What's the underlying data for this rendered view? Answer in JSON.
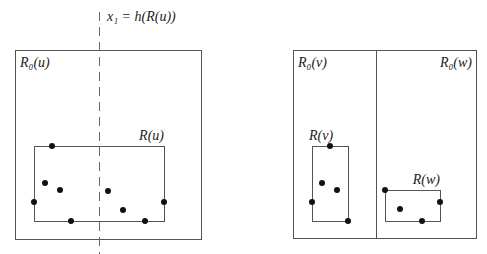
{
  "diagram": {
    "split_label": "x₁ = h(R(u))",
    "left_panel": {
      "outer": {
        "label": "R₀(u)",
        "x": 15,
        "y": 50,
        "w": 186,
        "h": 189
      },
      "inner": {
        "label": "R(u)",
        "x": 34,
        "y": 146,
        "w": 130,
        "h": 75
      },
      "split_x": 99,
      "points": [
        [
          52,
          146
        ],
        [
          45,
          183
        ],
        [
          60,
          190
        ],
        [
          34,
          202
        ],
        [
          71,
          221
        ],
        [
          108,
          191
        ],
        [
          123,
          210
        ],
        [
          145,
          221
        ],
        [
          164,
          202
        ]
      ]
    },
    "right_panel": {
      "outer": {
        "x": 293,
        "y": 50,
        "w": 183,
        "h": 188
      },
      "divider_x": 376,
      "left_cell_label": "R₀(v)",
      "right_cell_label": "R₀(w)",
      "inner_v": {
        "label": "R(v)",
        "x": 312,
        "y": 146,
        "w": 36,
        "h": 75
      },
      "inner_w": {
        "label": "R(w)",
        "x": 385,
        "y": 190,
        "w": 55,
        "h": 31
      },
      "points_v": [
        [
          330,
          146
        ],
        [
          322,
          183
        ],
        [
          337,
          190
        ],
        [
          312,
          202
        ],
        [
          348,
          221
        ]
      ],
      "points_w": [
        [
          385,
          190
        ],
        [
          400,
          209
        ],
        [
          422,
          221
        ],
        [
          440,
          202
        ]
      ]
    }
  }
}
